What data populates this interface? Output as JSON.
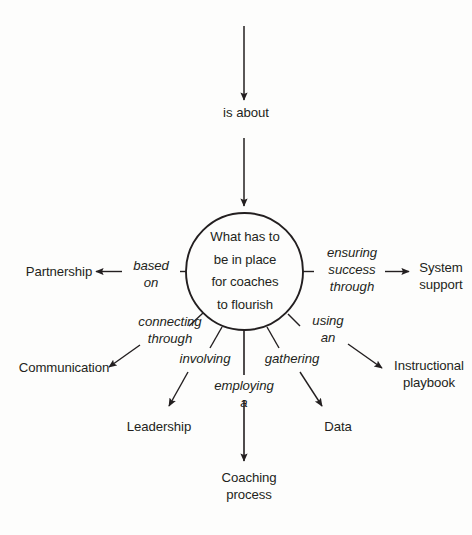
{
  "diagram": {
    "type": "concept-map",
    "title": "What has to be in place for coaches to flourish",
    "background_color": "#fdfdfc",
    "ink_color": "#231f20",
    "hub": {
      "shape": "circle",
      "lines": [
        "What has to",
        "be in place",
        "for coaches",
        "to flourish"
      ]
    },
    "incoming": {
      "label": "is about"
    },
    "connectors": {
      "based_on": "based\non",
      "ensuring_success_through": "ensuring\nsuccess\nthrough",
      "connecting_through": "connecting\nthrough",
      "using_an": "using\nan",
      "involving": "involving",
      "gathering": "gathering",
      "employing_a": "employing\na"
    },
    "nodes": {
      "partnership": "Partnership",
      "communication": "Communication",
      "leadership": "Leadership",
      "coaching_process": "Coaching\nprocess",
      "data": "Data",
      "instructional_playbook": "Instructional\nplaybook",
      "system_support": "System\nsupport"
    }
  }
}
